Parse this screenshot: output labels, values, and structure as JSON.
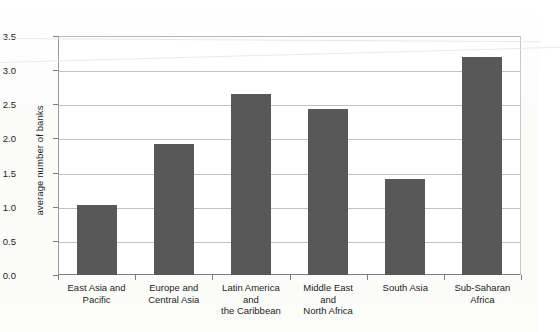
{
  "chart_data": {
    "type": "bar",
    "title": "",
    "xlabel": "",
    "ylabel": "average number of banks",
    "categories": [
      "East Asia and\nPacific",
      "Europe and\nCentral Asia",
      "Latin America\nand\nthe Caribbean",
      "Middle East\nand\nNorth Africa",
      "South Asia",
      "Sub-Saharan\nAfrica"
    ],
    "values": [
      1.02,
      1.92,
      2.65,
      2.43,
      1.41,
      3.2
    ],
    "ylim": [
      0.0,
      3.5
    ],
    "ytick_labels": [
      "0.0",
      "0.5",
      "1.0",
      "1.5",
      "2.0",
      "2.5",
      "3.0",
      "3.5"
    ],
    "ytick_values": [
      0.0,
      0.5,
      1.0,
      1.5,
      2.0,
      2.5,
      3.0,
      3.5
    ],
    "grid": true,
    "legend": "none",
    "bar_color": "#585858",
    "grid_color": "#c2c2c2",
    "axis_color": "#7d7d7d",
    "background_color": "#ffffff"
  }
}
